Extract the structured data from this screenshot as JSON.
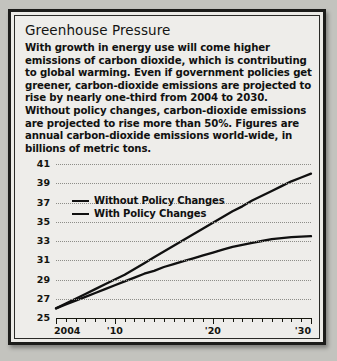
{
  "card": {
    "title": "Greenhouse Pressure",
    "blurb": "With growth in energy use will come higher emissions of carbon dioxide, which is contributing to global warming. Even if government policies get greener, carbon-dioxide emissions are projected to rise by nearly one-third from 2004 to 2030. Without policy changes, carbon-dioxide emissions are projected to rise more than 50%. Figures are annual carbon-dioxide emissions world-wide, in billions of metric tons."
  },
  "chart_data": {
    "type": "line",
    "title": "Greenhouse Pressure",
    "xlabel": "",
    "ylabel": "",
    "unit": "billions of metric tons",
    "grid": true,
    "legend_position": "upper-left-inside",
    "xlim": [
      2004,
      2030
    ],
    "ylim": [
      25,
      41
    ],
    "ytick_labels": [
      "41",
      "39",
      "37",
      "35",
      "33",
      "31",
      "29",
      "27",
      "25"
    ],
    "ytick_values": [
      41,
      39,
      37,
      35,
      33,
      31,
      29,
      27,
      25
    ],
    "xtick_labels": [
      "2004",
      "'10",
      "'20",
      "'30"
    ],
    "xtick_values": [
      2004,
      2010,
      2020,
      2030
    ],
    "x": [
      2004,
      2005,
      2006,
      2007,
      2008,
      2009,
      2010,
      2011,
      2012,
      2013,
      2014,
      2015,
      2016,
      2017,
      2018,
      2019,
      2020,
      2021,
      2022,
      2023,
      2024,
      2025,
      2026,
      2027,
      2028,
      2029,
      2030
    ],
    "series": [
      {
        "name": "Without Policy Changes",
        "color": "#101010",
        "values": [
          26.0,
          26.5,
          27.0,
          27.5,
          28.0,
          28.5,
          29.0,
          29.5,
          30.1,
          30.7,
          31.3,
          31.9,
          32.5,
          33.1,
          33.7,
          34.3,
          34.9,
          35.5,
          36.1,
          36.6,
          37.2,
          37.7,
          38.2,
          38.7,
          39.2,
          39.6,
          40.0
        ]
      },
      {
        "name": "With Policy Changes",
        "color": "#101010",
        "values": [
          26.0,
          26.4,
          26.8,
          27.2,
          27.6,
          28.0,
          28.4,
          28.8,
          29.2,
          29.6,
          29.9,
          30.3,
          30.6,
          30.9,
          31.2,
          31.5,
          31.8,
          32.1,
          32.4,
          32.6,
          32.8,
          33.0,
          33.2,
          33.3,
          33.4,
          33.45,
          33.5
        ]
      }
    ],
    "legend": [
      {
        "label": "Without Policy Changes"
      },
      {
        "label": "With Policy Changes"
      }
    ]
  }
}
